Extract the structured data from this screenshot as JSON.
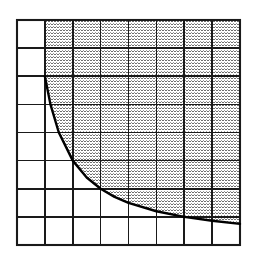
{
  "figure": {
    "title": "",
    "background_color": "#ffffff",
    "line_color": "#1a1a1a",
    "curve_color": "#000000",
    "shading_color": "#8c8c8c",
    "shading_style": "fine-dotted-stipple"
  },
  "chart_data": {
    "type": "area",
    "title": "",
    "xlabel": "",
    "ylabel": "",
    "grid": true,
    "legend_position": "none",
    "xlim": [
      0,
      8
    ],
    "ylim": [
      0,
      8
    ],
    "x_tick_labels": [],
    "y_tick_labels": [],
    "grid_columns": 8,
    "grid_rows": 8,
    "curve_name": "hyperbola",
    "curve_equation": "y = 6/x",
    "shaded_region": "above-and-right-of-curve",
    "x": [
      1.0,
      1.2,
      1.5,
      2.0,
      2.5,
      3.0,
      3.5,
      4.0,
      5.0,
      6.0,
      7.0,
      8.0
    ],
    "values": [
      6.0,
      5.0,
      4.0,
      3.0,
      2.4,
      2.0,
      1.71,
      1.5,
      1.2,
      1.0,
      0.86,
      0.75
    ],
    "series": [
      {
        "name": "y = 6/x",
        "values": [
          6.0,
          5.0,
          4.0,
          3.0,
          2.4,
          2.0,
          1.71,
          1.5,
          1.2,
          1.0,
          0.86,
          0.75
        ]
      }
    ]
  },
  "geometry": {
    "plot_left": 17,
    "plot_top": 20,
    "plot_right": 240,
    "plot_bottom": 245,
    "cell_width": 27.875,
    "cell_height": 28.125,
    "curve_start_x": 45,
    "curve_start_y": 76,
    "curve_end_x": 212,
    "curve_end_y": 245
  }
}
